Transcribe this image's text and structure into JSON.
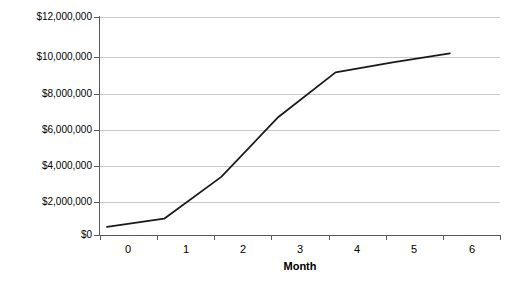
{
  "chart_data": {
    "type": "line",
    "title": "",
    "subtitle": "",
    "xlabel": "Month",
    "ylabel": "",
    "categories": [
      "0",
      "1",
      "2",
      "3",
      "4",
      "5",
      "6"
    ],
    "x": [
      0,
      1,
      2,
      3,
      4,
      5,
      6
    ],
    "values": [
      450000,
      900000,
      3200000,
      6500000,
      8950000,
      9500000,
      10000000
    ],
    "series": [
      {
        "name": "",
        "values": [
          450000,
          900000,
          3200000,
          6500000,
          8950000,
          9500000,
          10000000
        ]
      }
    ],
    "ylim": [
      0,
      12000000
    ],
    "ytick_values": [
      0,
      2000000,
      4000000,
      6000000,
      8000000,
      10000000,
      12000000
    ],
    "ytick_labels": [
      "$0",
      "$2,000,000",
      "$4,000,000",
      "$6,000,000",
      "$8,000,000",
      "$10,000,000",
      "$12,000,000"
    ],
    "xtick_labels": [
      "0",
      "1",
      "2",
      "3",
      "4",
      "5",
      "6"
    ],
    "grid": "horizontal",
    "legend": "none",
    "line_color": "#1a1a1a",
    "grid_color": "#c8c8c8",
    "axis_color": "#5a5a5a",
    "background_color": "#ffffff",
    "annotations": []
  },
  "axis_titles": {
    "x": "Month"
  }
}
